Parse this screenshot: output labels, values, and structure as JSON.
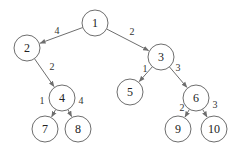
{
  "diagram": {
    "type": "weighted-tree",
    "nodes": [
      {
        "id": "1",
        "label": "1",
        "x": 95,
        "y": 23
      },
      {
        "id": "2",
        "label": "2",
        "x": 27,
        "y": 48
      },
      {
        "id": "3",
        "label": "3",
        "x": 161,
        "y": 57
      },
      {
        "id": "4",
        "label": "4",
        "x": 62,
        "y": 98
      },
      {
        "id": "5",
        "label": "5",
        "x": 130,
        "y": 92
      },
      {
        "id": "6",
        "label": "6",
        "x": 196,
        "y": 98
      },
      {
        "id": "7",
        "label": "7",
        "x": 45,
        "y": 129
      },
      {
        "id": "8",
        "label": "8",
        "x": 78,
        "y": 129
      },
      {
        "id": "9",
        "label": "9",
        "x": 178,
        "y": 129
      },
      {
        "id": "10",
        "label": "10",
        "x": 214,
        "y": 129
      }
    ],
    "edges": [
      {
        "from": "1",
        "to": "2",
        "weight": "4",
        "lx": 57,
        "ly": 30
      },
      {
        "from": "1",
        "to": "3",
        "weight": "2",
        "lx": 132,
        "ly": 31
      },
      {
        "from": "2",
        "to": "4",
        "weight": "2",
        "lx": 52,
        "ly": 66
      },
      {
        "from": "3",
        "to": "5",
        "weight": "1",
        "lx": 145,
        "ly": 68
      },
      {
        "from": "3",
        "to": "6",
        "weight": "3",
        "lx": 178,
        "ly": 67
      },
      {
        "from": "4",
        "to": "7",
        "weight": "1",
        "lx": 42,
        "ly": 100
      },
      {
        "from": "4",
        "to": "8",
        "weight": "4",
        "lx": 81,
        "ly": 100
      },
      {
        "from": "6",
        "to": "9",
        "weight": "2",
        "lx": 182,
        "ly": 107
      },
      {
        "from": "6",
        "to": "10",
        "weight": "3",
        "lx": 215,
        "ly": 104
      }
    ],
    "node_radius": 13,
    "stroke_color": "#6e6e6e"
  }
}
